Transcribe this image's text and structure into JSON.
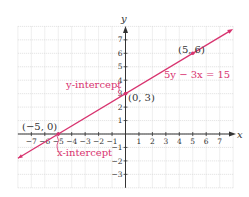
{
  "chart_data": {
    "type": "line",
    "title": "",
    "xlabel": "x",
    "ylabel": "y",
    "xlim": [
      -8,
      8
    ],
    "ylim": [
      -4,
      8
    ],
    "grid": true,
    "x_ticks": [
      -7,
      -6,
      -5,
      -4,
      -3,
      -2,
      -1,
      1,
      2,
      3,
      4,
      5,
      6,
      7
    ],
    "y_ticks": [
      -3,
      -2,
      -1,
      1,
      2,
      3,
      4,
      5,
      6,
      7
    ],
    "series": [
      {
        "name": "5y − 3x = 15",
        "equation": "5y − 3x = 15",
        "color": "#d8336f",
        "x": [
          -8,
          -5,
          0,
          5,
          8
        ],
        "y": [
          -1.8,
          0,
          3,
          6,
          7.8
        ]
      }
    ],
    "points": [
      {
        "x": -5,
        "y": 0,
        "label": "(−5, 0)"
      },
      {
        "x": 0,
        "y": 3,
        "label": "(0, 3)"
      },
      {
        "x": 5,
        "y": 6,
        "label": "(5, 6)"
      }
    ],
    "annotations": [
      {
        "text": "y-intercept",
        "target": "(0, 3)"
      },
      {
        "text": "x-intercept",
        "target": "(−5, 0)"
      },
      {
        "text": "5y − 3x = 15",
        "target": "line"
      }
    ]
  },
  "labels": {
    "x_axis": "x",
    "y_axis": "y",
    "equation": "5y − 3x = 15",
    "y_intercept": "y-intercept",
    "x_intercept": "x-intercept",
    "point_a": "(−5, 0)",
    "point_b": "(0, 3)",
    "point_c": "(5, 6)"
  },
  "colors": {
    "line": "#d8336f",
    "annotation": "#d8336f",
    "axis": "#333333",
    "grid": "#d4d4d4"
  }
}
